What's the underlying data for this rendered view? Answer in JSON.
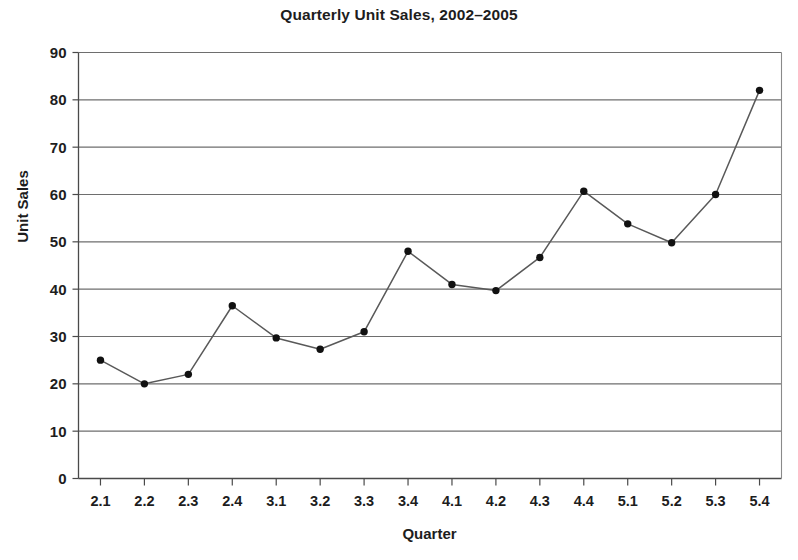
{
  "chart_data": {
    "type": "line",
    "title": "Quarterly Unit Sales, 2002–2005",
    "xlabel": "Quarter",
    "ylabel": "Unit Sales",
    "categories": [
      "2.1",
      "2.2",
      "2.3",
      "2.4",
      "3.1",
      "3.2",
      "3.3",
      "3.4",
      "4.1",
      "4.2",
      "4.3",
      "4.4",
      "5.1",
      "5.2",
      "5.3",
      "5.4"
    ],
    "values": [
      25,
      20,
      22,
      36.5,
      29.7,
      27.3,
      31,
      48,
      41,
      39.7,
      46.7,
      60.7,
      53.8,
      49.8,
      60,
      82
    ],
    "ylim": [
      0,
      90
    ],
    "yticks": [
      0,
      10,
      20,
      30,
      40,
      50,
      60,
      70,
      80,
      90
    ],
    "grid": "horizontal",
    "legend": "none",
    "series_color": "#595959",
    "marker_color": "#111111",
    "gridline_color": "#6e6e6e",
    "axis_color": "#4a4a4a",
    "background": "#ffffff"
  }
}
